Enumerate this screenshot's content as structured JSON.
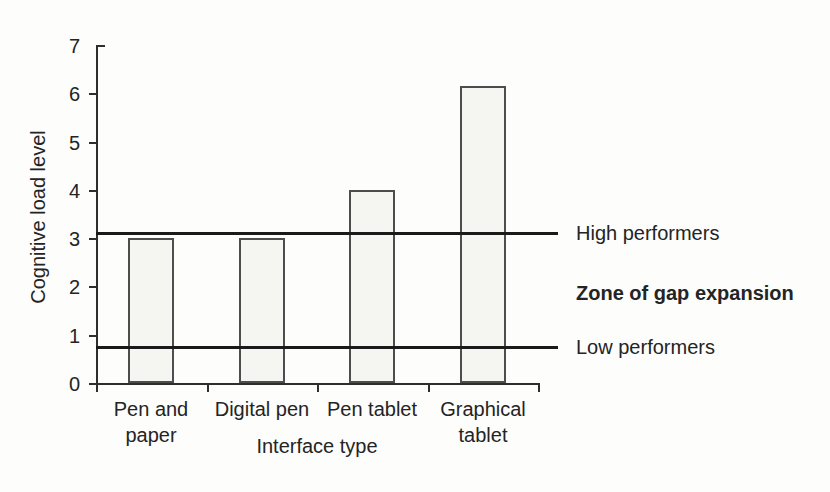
{
  "figure": {
    "background": "#fdfdfc",
    "text_color": "#242424",
    "axis_color": "#2e2e2e",
    "bar_fill": "#f5f5f2",
    "bar_border": "#4d4d4d",
    "ref_line_color": "#1a1a1a"
  },
  "chart_data": {
    "type": "bar",
    "title": "",
    "xlabel": "Interface type",
    "ylabel": "Cognitive load level",
    "categories": [
      "Pen and\npaper",
      "Digital pen",
      "Pen tablet",
      "Graphical\ntablet"
    ],
    "values": [
      3.0,
      3.0,
      4.0,
      6.15
    ],
    "ylim": [
      0,
      7
    ],
    "yticks": [
      0,
      1,
      2,
      3,
      4,
      5,
      6,
      7
    ],
    "grid": false,
    "legend": "none",
    "reference_lines": [
      {
        "label": "High performers",
        "value": 3.1,
        "bold": false
      },
      {
        "label": "Low performers",
        "value": 0.75,
        "bold": false
      }
    ],
    "annotations": [
      {
        "label": "Zone of gap expansion",
        "value": 1.86,
        "bold": true
      }
    ]
  }
}
